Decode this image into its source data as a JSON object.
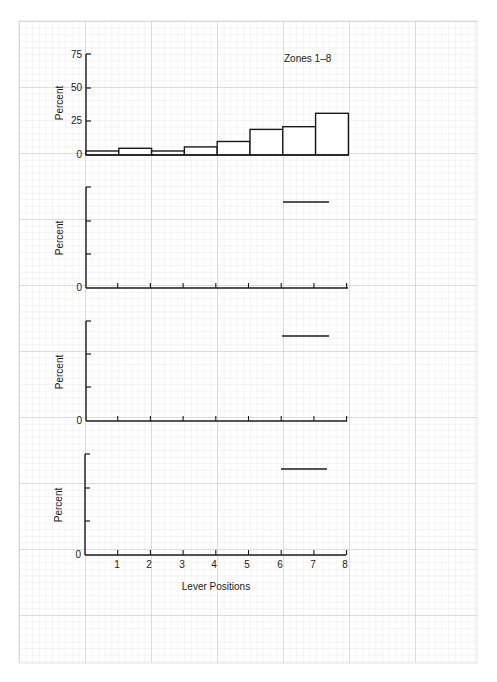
{
  "chart_data": [
    {
      "type": "bar",
      "panel": 1,
      "title": "Zones 1–8",
      "xlabel": "",
      "ylabel": "Percent",
      "ylim": [
        0,
        75
      ],
      "yticks": [
        0,
        25,
        50,
        75
      ],
      "ytick_labels": [
        "0",
        "25",
        "50",
        "75"
      ],
      "categories": [
        "1",
        "2",
        "3",
        "4",
        "5",
        "6",
        "7",
        "8"
      ],
      "bin_edges": [
        0,
        1,
        2,
        3,
        4,
        5,
        6,
        7,
        8
      ],
      "values": [
        3,
        5,
        3,
        6,
        10,
        19,
        21,
        31
      ],
      "grid": true
    },
    {
      "type": "line",
      "panel": 2,
      "title": "",
      "ylabel": "Percent",
      "ytick_labels": [
        "0"
      ],
      "segments": [
        {
          "x": [
            6,
            7.4
          ],
          "y_frac": 0.86
        }
      ],
      "xlim": [
        0,
        8
      ],
      "grid": true
    },
    {
      "type": "line",
      "panel": 3,
      "title": "",
      "ylabel": "Percent",
      "ytick_labels": [
        "0"
      ],
      "segments": [
        {
          "x": [
            6,
            7.4
          ],
          "y_frac": 0.85
        }
      ],
      "xlim": [
        0,
        8
      ],
      "grid": true
    },
    {
      "type": "line",
      "panel": 4,
      "title": "",
      "ylabel": "Percent",
      "xlabel": "Lever Positions",
      "ytick_labels": [
        "0"
      ],
      "xticks": [
        1,
        2,
        3,
        4,
        5,
        6,
        7,
        8
      ],
      "xtick_labels": [
        "1",
        "2",
        "3",
        "4",
        "5",
        "6",
        "7",
        "8"
      ],
      "segments": [
        {
          "x": [
            6,
            7.4
          ],
          "y_frac": 0.85
        }
      ],
      "xlim": [
        0,
        8
      ],
      "grid": true
    }
  ],
  "labels": {
    "panel1_title": "Zones 1–8",
    "ylabel": "Percent",
    "xlabel": "Lever Positions",
    "zero": "0",
    "y75": "75",
    "y50": "50",
    "y25": "25",
    "x1": "1",
    "x2": "2",
    "x3": "3",
    "x4": "4",
    "x5": "5",
    "x6": "6",
    "x7": "7",
    "x8": "8"
  },
  "colors": {
    "ink": "#1a1a1a",
    "grid_minor": "#d9d9d9",
    "grid_major": "#b8b8b8",
    "paper": "#ffffff"
  }
}
